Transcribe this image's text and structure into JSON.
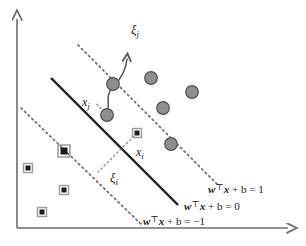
{
  "figure": {
    "type": "svm-soft-margin-diagram",
    "title": "",
    "axes": {
      "x_axis_label": "",
      "y_axis_label": "",
      "origin": [
        17,
        228
      ],
      "x_end": [
        292,
        228
      ],
      "y_top": [
        17,
        15
      ],
      "color": "#6e6e6e"
    },
    "colors": {
      "axis": "#6e6e6e",
      "solid_line": "#1a1a1a",
      "dotted_line": "#6a6a6a",
      "circle_fill": "#8f8f8f",
      "circle_stroke": "#4f4f4f",
      "square_fill": "#1c1c1c",
      "square_halo": "#9a9a9a",
      "text": "#1a1a1a",
      "arrow": "#555555"
    },
    "lines": [
      {
        "name": "decision-boundary",
        "style": "solid",
        "equation": "wᵀx + b = 0",
        "x1": 51,
        "y1": 78,
        "x2": 178,
        "y2": 205
      },
      {
        "name": "positive-margin",
        "style": "dotted",
        "equation": "wᵀx + b = 1",
        "x1": 78,
        "y1": 45,
        "x2": 218,
        "y2": 185
      },
      {
        "name": "negative-margin",
        "style": "dotted",
        "equation": "wᵀx + b = -1",
        "x1": 21,
        "y1": 108,
        "x2": 141,
        "y2": 224
      }
    ],
    "equations": [
      {
        "name": "eq-positive-margin",
        "bold_w": "w",
        "transpose": "⊤",
        "bold_x": "x",
        "rest": " + b = 1",
        "x": 208,
        "y": 192
      },
      {
        "name": "eq-decision-boundary",
        "bold_w": "w",
        "transpose": "⊤",
        "bold_x": "x",
        "rest": " + b = 0",
        "x": 184,
        "y": 209
      },
      {
        "name": "eq-negative-margin",
        "bold_w": "w",
        "transpose": "⊤",
        "bold_x": "x",
        "rest": " + b = −1",
        "x": 143,
        "y": 224
      }
    ],
    "point_labels": [
      {
        "name": "label-xj",
        "base": "x",
        "sub": "j",
        "x": 85,
        "y": 104
      },
      {
        "name": "label-xi",
        "base": "x",
        "sub": "i",
        "x": 138,
        "y": 155
      }
    ],
    "slack_labels": [
      {
        "name": "label-xi-j",
        "base": "ξ",
        "sub": "j",
        "x": 133,
        "y": 32
      },
      {
        "name": "label-xi-i",
        "base": "ξ",
        "sub": "i",
        "x": 113,
        "y": 180
      }
    ],
    "markers": {
      "circles": [
        {
          "cx": 113,
          "cy": 84,
          "r": 6.5,
          "on_margin": false
        },
        {
          "cx": 107,
          "cy": 115,
          "r": 6.5,
          "on_margin": false
        },
        {
          "cx": 151,
          "cy": 78,
          "r": 6.5,
          "on_margin": false
        },
        {
          "cx": 163,
          "cy": 108,
          "r": 6.5,
          "on_margin": false
        },
        {
          "cx": 192,
          "cy": 92,
          "r": 6.5,
          "on_margin": false
        },
        {
          "cx": 171,
          "cy": 144,
          "r": 6.5,
          "on_margin": true
        }
      ],
      "squares": [
        {
          "cx": 137,
          "cy": 133,
          "s": 9,
          "on_margin": false
        },
        {
          "cx": 64,
          "cy": 151,
          "s": 11,
          "on_margin": true
        },
        {
          "cx": 28,
          "cy": 168,
          "s": 9,
          "on_margin": false
        },
        {
          "cx": 64,
          "cy": 190,
          "s": 9,
          "on_margin": false
        },
        {
          "cx": 42,
          "cy": 212,
          "s": 9,
          "on_margin": false
        }
      ]
    },
    "connectors": [
      {
        "name": "connector-xi",
        "style": "dotted",
        "from": [
          137,
          133
        ],
        "to": [
          98,
          172
        ],
        "description": "perpendicular from x_i to negative margin"
      },
      {
        "name": "connector-xj",
        "style": "dotted",
        "from": [
          107,
          115
        ],
        "to": [
          96,
          104
        ],
        "description": "short dotted stub from x_j"
      }
    ],
    "slack_arrow": {
      "name": "slack-arrow-j",
      "path": "M 104 117 C 112 106, 104 96, 114 86 C 122 78, 126 70, 127 58",
      "arrow_tip": [
        127,
        54
      ],
      "description": "curved arrow from x_j circle upward labelled xi_j"
    }
  }
}
